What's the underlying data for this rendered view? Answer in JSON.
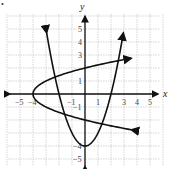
{
  "chart_data": {
    "type": "line",
    "title": "",
    "xlabel": "x",
    "ylabel": "y",
    "xlim": [
      -5,
      5
    ],
    "ylim": [
      -5,
      5
    ],
    "grid": true,
    "x_ticks": [
      "−5",
      "−4",
      "−1",
      "1",
      "3",
      "4",
      "5"
    ],
    "y_ticks": [
      "5",
      "4",
      "3",
      "1",
      "−1",
      "−4",
      "−5"
    ],
    "series": [
      {
        "name": "vertical parabola",
        "equation": "y = x^2 - 4",
        "vertex": [
          0,
          -4
        ],
        "x_intercepts": [
          -2,
          2
        ],
        "arrows": true
      },
      {
        "name": "horizontal parabola",
        "equation": "x = y^2 - 4",
        "vertex": [
          -4,
          0
        ],
        "y_intercepts": [
          -2,
          2
        ],
        "arrows": true
      }
    ]
  },
  "bullet": "•"
}
